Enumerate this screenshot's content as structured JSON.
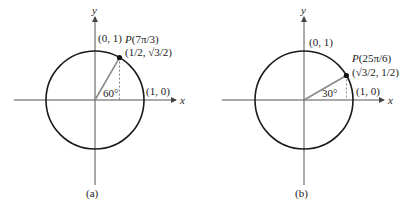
{
  "figures": [
    {
      "id": "a",
      "caption": "(a)",
      "axis_x_label": "x",
      "axis_y_label": "y",
      "top_point_label": "(0, 1)",
      "right_point_label": "(1, 0)",
      "point_name": "P(7π/3)",
      "point_coords": "(1/2, √3/2)",
      "angle_label": "60°",
      "angle_deg": 60
    },
    {
      "id": "b",
      "caption": "(b)",
      "axis_x_label": "x",
      "axis_y_label": "y",
      "top_point_label": "(0, 1)",
      "right_point_label": "(1, 0)",
      "point_name": "P(25π/6)",
      "point_coords": "(√3/2, 1/2)",
      "angle_label": "30°",
      "angle_deg": 30
    }
  ],
  "colors": {
    "circle": "#1a1a1a",
    "radius": "#8a8a8a",
    "axes": "#555555"
  }
}
